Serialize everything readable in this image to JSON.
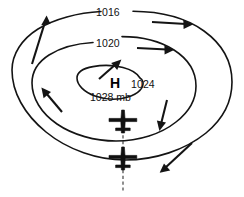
{
  "diagram": {
    "center": {
      "symbol": "H",
      "pressure_label": "1028 mb"
    },
    "isobars": [
      {
        "label": "1016",
        "pressure": 1016,
        "ring": "outer"
      },
      {
        "label": "1020",
        "pressure": 1020,
        "ring": "middle"
      },
      {
        "label": "1024",
        "pressure": 1024,
        "ring": "inner-middle"
      }
    ],
    "aircraft": [
      {
        "name": "aircraft-upper",
        "heading": "north"
      },
      {
        "name": "aircraft-lower",
        "heading": "north"
      }
    ],
    "wind_arrows": [
      {
        "name": "wind-arrow-upper-left",
        "direction": "up-right"
      },
      {
        "name": "wind-arrow-top-right",
        "direction": "right"
      },
      {
        "name": "wind-arrow-middle-right",
        "direction": "right"
      },
      {
        "name": "wind-arrow-inner-top",
        "direction": "up-right"
      },
      {
        "name": "wind-arrow-left",
        "direction": "up-left"
      },
      {
        "name": "wind-arrow-right-descending",
        "direction": "down"
      },
      {
        "name": "wind-arrow-lower-right",
        "direction": "down-left"
      }
    ],
    "track": {
      "name": "flight-track",
      "style": "dashed"
    },
    "colors": {
      "stroke": "#141414",
      "background": "#ffffff",
      "track": "#333333"
    }
  }
}
